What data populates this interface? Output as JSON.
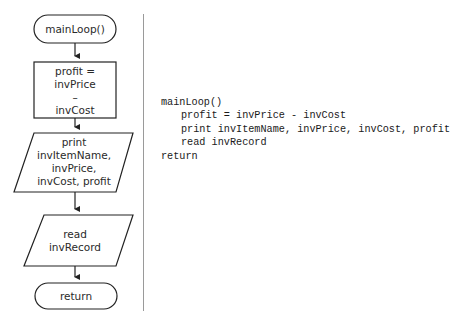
{
  "flowchart": {
    "start": {
      "label": "mainLoop()"
    },
    "process": {
      "lines": [
        "profit =",
        "invPrice",
        "–",
        "invCost"
      ]
    },
    "output": {
      "lines": [
        "print",
        "invItemName,",
        "invPrice,",
        "invCost, profit"
      ]
    },
    "input": {
      "lines": [
        "read",
        "invRecord"
      ]
    },
    "end": {
      "label": "return"
    }
  },
  "pseudocode": {
    "lines": [
      {
        "text": "mainLoop()",
        "indent": 0
      },
      {
        "text": "profit = invPrice - invCost",
        "indent": 1
      },
      {
        "text": "print invItemName, invPrice, invCost, profit",
        "indent": 1
      },
      {
        "text": "read invRecord",
        "indent": 1
      },
      {
        "text": "return",
        "indent": 0
      }
    ]
  }
}
